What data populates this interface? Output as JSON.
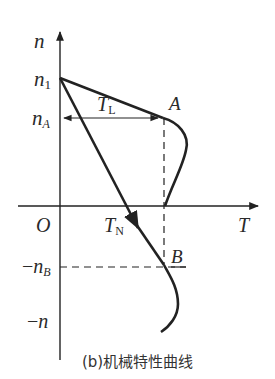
{
  "caption": "(b)机械特性曲线",
  "axes": {
    "y_label": "n",
    "x_label": "T",
    "origin_label": "O"
  },
  "labels": {
    "n1": {
      "main": "n",
      "sub": "1"
    },
    "nA": {
      "main": "n",
      "sub": "A"
    },
    "neg_nB": {
      "prefix": "−",
      "main": "n",
      "sub": "B"
    },
    "neg_n": {
      "prefix": "−",
      "main": "n"
    },
    "TL": {
      "main": "T",
      "sub": "L"
    },
    "TN": {
      "main": "T",
      "sub": "N"
    },
    "pointA": "A",
    "pointB": "B"
  },
  "colors": {
    "stroke": "#222222",
    "text": "#2a2a2a"
  }
}
